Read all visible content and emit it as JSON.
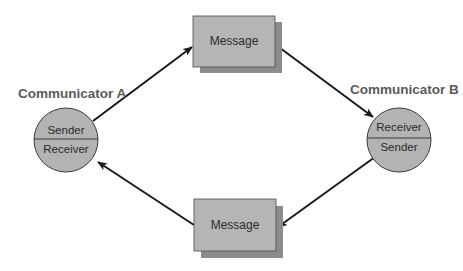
{
  "diagram": {
    "colors": {
      "circle_fill": "#b3b3b3",
      "box_fill": "#b5b5b5",
      "box_shadow": "#8c8c8c",
      "outline": "#3a3a3a",
      "arrow": "#1a1a1a",
      "title_text": "#5a5a5a",
      "body_text": "#2a2a2a"
    },
    "communicator_a": {
      "title": "Communicator A",
      "top_label": "Sender",
      "bottom_label": "Receiver"
    },
    "communicator_b": {
      "title": "Communicator B",
      "top_label": "Receiver",
      "bottom_label": "Sender"
    },
    "message_top": {
      "label": "Message"
    },
    "message_bottom": {
      "label": "Message"
    },
    "edges": [
      {
        "from": "communicator_a",
        "to": "message_top"
      },
      {
        "from": "message_top",
        "to": "communicator_b"
      },
      {
        "from": "communicator_b",
        "to": "message_bottom"
      },
      {
        "from": "message_bottom",
        "to": "communicator_a"
      }
    ]
  }
}
